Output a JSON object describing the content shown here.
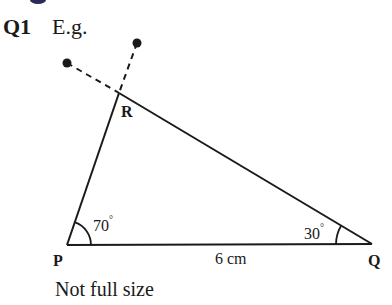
{
  "question": {
    "number": "Q1",
    "intro": "E.g."
  },
  "triangle": {
    "vertices": {
      "P": {
        "label": "P",
        "x": 67,
        "y": 245
      },
      "Q": {
        "label": "Q",
        "x": 372,
        "y": 244
      },
      "R": {
        "label": "R",
        "x": 119,
        "y": 93
      }
    },
    "angles": {
      "P": {
        "value": "70",
        "unit": "°"
      },
      "Q": {
        "value": "30",
        "unit": "°"
      }
    },
    "side_PQ": "6 cm"
  },
  "construction": {
    "points": [
      {
        "x": 67,
        "y": 63
      },
      {
        "x": 137,
        "y": 43
      }
    ],
    "style": "dashed"
  },
  "note": "Not full size",
  "colors": {
    "ink": "#1a1a1a",
    "top_fragment": "#2a2a5a"
  }
}
